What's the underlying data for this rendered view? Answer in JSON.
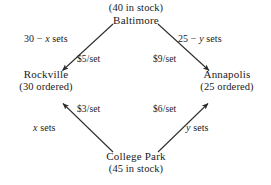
{
  "diagram": {
    "type": "transportation-network",
    "stroke_color": "#2b2b2b",
    "text_color": "#1a1a1a",
    "background_color": "#ffffff",
    "nodes": [
      {
        "id": "baltimore",
        "name": "Baltimore",
        "annotation": "(40 in stock)",
        "annotation_position": "above",
        "role": "supply",
        "quantity": 40,
        "position": "top"
      },
      {
        "id": "rockville",
        "name": "Rockville",
        "annotation": "(30 ordered)",
        "annotation_position": "below",
        "role": "demand",
        "quantity": 30,
        "position": "left"
      },
      {
        "id": "annapolis",
        "name": "Annapolis",
        "annotation": "(25 ordered)",
        "annotation_position": "below",
        "role": "demand",
        "quantity": 25,
        "position": "right"
      },
      {
        "id": "collegepark",
        "name": "College Park",
        "annotation": "(45 in stock)",
        "annotation_position": "below",
        "role": "supply",
        "quantity": 45,
        "position": "bottom"
      }
    ],
    "edges": [
      {
        "id": "bal-rock",
        "from": "baltimore",
        "to": "rockville",
        "quantity_label": "30 − x sets",
        "quantity_prefix": "30 − ",
        "quantity_var": "x",
        "quantity_suffix": " sets",
        "cost_label": "$5/set",
        "cost": 5
      },
      {
        "id": "bal-anna",
        "from": "baltimore",
        "to": "annapolis",
        "quantity_label": "25 − y sets",
        "quantity_prefix": "25 − ",
        "quantity_var": "y",
        "quantity_suffix": " sets",
        "cost_label": "$9/set",
        "cost": 9
      },
      {
        "id": "cp-rock",
        "from": "collegepark",
        "to": "rockville",
        "quantity_label": "x sets",
        "quantity_prefix": "",
        "quantity_var": "x",
        "quantity_suffix": " sets",
        "cost_label": "$3/set",
        "cost": 3
      },
      {
        "id": "cp-anna",
        "from": "collegepark",
        "to": "annapolis",
        "quantity_label": "y sets",
        "quantity_prefix": "",
        "quantity_var": "y",
        "quantity_suffix": " sets",
        "cost_label": "$6/set",
        "cost": 6
      }
    ]
  }
}
